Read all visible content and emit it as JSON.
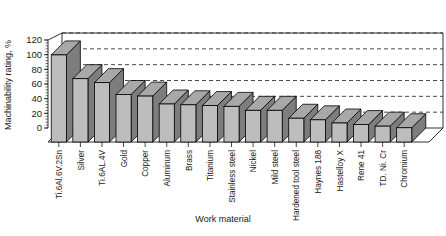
{
  "chart_data": {
    "type": "bar",
    "title": "",
    "subtitle": "",
    "xlabel": "Work material",
    "ylabel": "Machinability rating, %",
    "ylim": [
      0,
      120
    ],
    "yticks": [
      0,
      20,
      40,
      60,
      80,
      100,
      120
    ],
    "grid": true,
    "legend": false,
    "style": "3d-bar-grayscale",
    "categories": [
      "Ti.6Al.6V.2Sn",
      "Silver",
      "Ti.6AL.4V",
      "Gold",
      "Copper",
      "Aluminum",
      "Brass",
      "Titanium",
      "Stainless steel",
      "Nickel",
      "Mild steel",
      "Hardened tool steel",
      "Haynes 188",
      "Hastelloy X",
      "Rene 41",
      "TD. Ni. Cr",
      "Chromium"
    ],
    "values": [
      110,
      80,
      75,
      60,
      58,
      48,
      47,
      46,
      45,
      40,
      40,
      30,
      28,
      24,
      22,
      20,
      18
    ],
    "bar_colors": {
      "front": "#bdbdbd",
      "side": "#7d7d7d",
      "top": "#a8a8a8",
      "outline": "#000000"
    },
    "plot_colors": {
      "background": "#ffffff",
      "gridline": "#1a1a1a",
      "axis": "#000000",
      "floor": "#ffffff",
      "backwall": "#ffffff"
    }
  },
  "axes": {
    "y_axis_title": "Machinability rating, %",
    "x_axis_title": "Work material"
  }
}
